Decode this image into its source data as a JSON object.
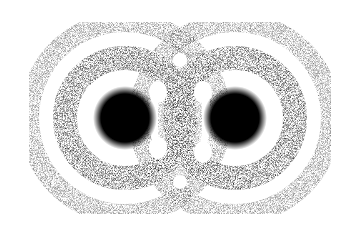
{
  "image": {
    "description": "Stippled dot illustration of two overlapping concentric ring patterns with dense dark cores",
    "background": "#ffffff",
    "ink": "#000000",
    "centers": [
      {
        "name": "left-core",
        "cx": 125,
        "cy": 118
      },
      {
        "name": "right-core",
        "cx": 235,
        "cy": 118
      }
    ],
    "core_radius": 30,
    "inner_ring_radius": 62,
    "outer_ring_radius": 98
  }
}
